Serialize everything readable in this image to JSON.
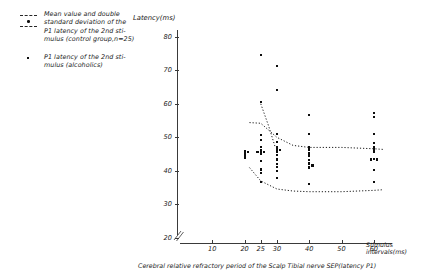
{
  "legend": {
    "entries": [
      {
        "marker": "dashed-lines-with-dot",
        "text": "Mean value and double\nstandard deviation of the\nP1 latency of the 2nd sti-\nmulus (control group,n=25)"
      },
      {
        "marker": "small-square-dot",
        "text": "P1 latency of the 2nd sti-\nmulus (alcoholics)"
      }
    ]
  },
  "caption": "Cerebral relative refractory period of the Scalp Tibial nerve SEP(latency P1)",
  "chart_data": {
    "type": "scatter",
    "title": "",
    "xlabel": "Stimulus intervals(ms)",
    "ylabel": "Latency(ms)",
    "xlim": [
      0,
      65
    ],
    "ylim": [
      20,
      82
    ],
    "xticks": [
      10,
      20,
      25,
      30,
      40,
      50,
      60
    ],
    "yticks": [
      20,
      30,
      40,
      50,
      60,
      70,
      80
    ],
    "grid": false,
    "legend_position": "top-left-outside",
    "axis_break_y": true,
    "series": [
      {
        "name": "P1 latency of the 2nd stimulus (alcoholics)",
        "marker": "dot",
        "points": [
          {
            "x": 20,
            "y": 46.0
          },
          {
            "x": 20,
            "y": 45.4
          },
          {
            "x": 20,
            "y": 44.6
          },
          {
            "x": 20,
            "y": 43.9
          },
          {
            "x": 21,
            "y": 45.6
          },
          {
            "x": 25,
            "y": 74.5
          },
          {
            "x": 25,
            "y": 60.6
          },
          {
            "x": 25,
            "y": 50.6
          },
          {
            "x": 25,
            "y": 49.1
          },
          {
            "x": 25,
            "y": 47.2
          },
          {
            "x": 25,
            "y": 46.2
          },
          {
            "x": 25,
            "y": 45.8
          },
          {
            "x": 25,
            "y": 45.2
          },
          {
            "x": 25,
            "y": 43.0
          },
          {
            "x": 25,
            "y": 40.4
          },
          {
            "x": 25,
            "y": 39.4
          },
          {
            "x": 25,
            "y": 36.6
          },
          {
            "x": 26,
            "y": 45.6
          },
          {
            "x": 24,
            "y": 45.6
          },
          {
            "x": 30,
            "y": 71.3
          },
          {
            "x": 30,
            "y": 64.0
          },
          {
            "x": 30,
            "y": 51.0
          },
          {
            "x": 30,
            "y": 48.6
          },
          {
            "x": 30,
            "y": 47.0
          },
          {
            "x": 30,
            "y": 46.2
          },
          {
            "x": 30,
            "y": 45.6
          },
          {
            "x": 30,
            "y": 44.8
          },
          {
            "x": 30,
            "y": 43.4
          },
          {
            "x": 30,
            "y": 42.0
          },
          {
            "x": 30,
            "y": 41.2
          },
          {
            "x": 30,
            "y": 40.0
          },
          {
            "x": 30,
            "y": 38.0
          },
          {
            "x": 31,
            "y": 46.2
          },
          {
            "x": 40,
            "y": 56.6
          },
          {
            "x": 40,
            "y": 51.0
          },
          {
            "x": 40,
            "y": 47.0
          },
          {
            "x": 40,
            "y": 46.2
          },
          {
            "x": 40,
            "y": 45.4
          },
          {
            "x": 40,
            "y": 44.6
          },
          {
            "x": 40,
            "y": 43.2
          },
          {
            "x": 40,
            "y": 42.2
          },
          {
            "x": 40,
            "y": 41.0
          },
          {
            "x": 41,
            "y": 41.6
          },
          {
            "x": 40,
            "y": 36.2
          },
          {
            "x": 60,
            "y": 57.2
          },
          {
            "x": 60,
            "y": 56.0
          },
          {
            "x": 60,
            "y": 51.0
          },
          {
            "x": 60,
            "y": 48.4
          },
          {
            "x": 60,
            "y": 47.2
          },
          {
            "x": 60,
            "y": 46.4
          },
          {
            "x": 60,
            "y": 45.6
          },
          {
            "x": 60,
            "y": 43.6
          },
          {
            "x": 61,
            "y": 43.4
          },
          {
            "x": 59,
            "y": 43.4
          },
          {
            "x": 60,
            "y": 40.2
          },
          {
            "x": 60,
            "y": 36.6
          }
        ]
      }
    ],
    "bands": [
      {
        "name": "upper bound (mean + 2SD, control group)",
        "style": "dotted",
        "points": [
          {
            "x": 21.5,
            "y": 54.4
          },
          {
            "x": 25,
            "y": 54.2
          },
          {
            "x": 30,
            "y": 50.0
          },
          {
            "x": 35,
            "y": 47.6
          },
          {
            "x": 40,
            "y": 47.0
          },
          {
            "x": 50,
            "y": 47.0
          },
          {
            "x": 60,
            "y": 46.6
          },
          {
            "x": 63,
            "y": 46.4
          }
        ]
      },
      {
        "name": "lower bound (mean - 2SD, control group)",
        "style": "dotted",
        "points": [
          {
            "x": 21.5,
            "y": 41.0
          },
          {
            "x": 25,
            "y": 37.0
          },
          {
            "x": 30,
            "y": 34.6
          },
          {
            "x": 35,
            "y": 34.0
          },
          {
            "x": 40,
            "y": 33.8
          },
          {
            "x": 50,
            "y": 33.8
          },
          {
            "x": 60,
            "y": 34.2
          },
          {
            "x": 63,
            "y": 34.4
          }
        ]
      },
      {
        "name": "mean descending segment (control group)",
        "style": "dotted",
        "points": [
          {
            "x": 25,
            "y": 60.0
          },
          {
            "x": 27.5,
            "y": 53.2
          },
          {
            "x": 29.5,
            "y": 47.0
          }
        ]
      }
    ]
  }
}
